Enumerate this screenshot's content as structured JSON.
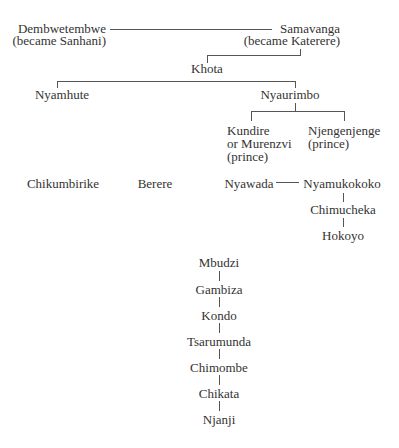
{
  "diagram": {
    "type": "family-tree",
    "nodes": {
      "dembwetembwe": {
        "name": "Dembwetembwe",
        "note": "(became Sanhani)"
      },
      "samavanga": {
        "name": "Samavanga",
        "note": "(became Katerere)"
      },
      "khota": {
        "name": "Khota"
      },
      "nyamhute": {
        "name": "Nyamhute"
      },
      "nyaurimbo": {
        "name": "Nyaurimbo"
      },
      "kundire": {
        "line1": "Kundire",
        "line2": "or Murenzvi",
        "line3": "(prince)"
      },
      "njengenjenge": {
        "name": "Njengenjenge",
        "note": "(prince)"
      },
      "chikumbirike": {
        "name": "Chikumbirike"
      },
      "berere": {
        "name": "Berere"
      },
      "nyawada": {
        "name": "Nyawada"
      },
      "nyamukokoko": {
        "name": "Nyamukokoko"
      },
      "chimucheka": {
        "name": "Chimucheka"
      },
      "hokoyo": {
        "name": "Hokoyo"
      }
    },
    "chain": [
      "Mbudzi",
      "Gambiza",
      "Kondo",
      "Tsarumunda",
      "Chimombe",
      "Chikata",
      "Njanji"
    ]
  }
}
